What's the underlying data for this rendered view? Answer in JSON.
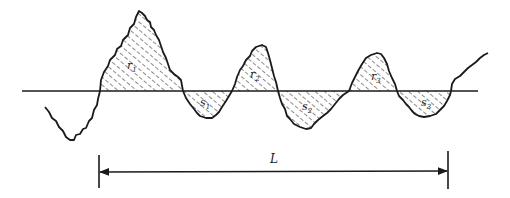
{
  "diagram": {
    "type": "surface-roughness-profile",
    "colors": {
      "stroke": "#1a1a1a",
      "hatch": "#1a1a1a",
      "background": "#ffffff"
    },
    "peaks": [
      {
        "id": "r1",
        "letter": "r",
        "sub": "1"
      },
      {
        "id": "r2",
        "letter": "r",
        "sub": "2"
      },
      {
        "id": "r3",
        "letter": "r",
        "sub": "3"
      }
    ],
    "valleys": [
      {
        "id": "s1",
        "letter": "s",
        "sub": "1"
      },
      {
        "id": "s2",
        "letter": "s",
        "sub": "2"
      },
      {
        "id": "s3",
        "letter": "s",
        "sub": "3"
      }
    ],
    "length_label": "L"
  }
}
